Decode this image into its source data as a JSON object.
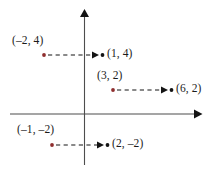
{
  "figure": {
    "kind": "coordinate-plane-translation-diagram",
    "width": 213,
    "height": 173,
    "background_color": "#ffffff"
  },
  "axes": {
    "x_axis": {
      "label": "x-axis",
      "color": "#4d4d4d",
      "y_pixel": 114,
      "x_start_pixel": 10,
      "x_end_pixel": 200,
      "arrow_end": "right"
    },
    "y_axis": {
      "label": "y-axis",
      "color": "#4d4d4d",
      "x_pixel": 84,
      "y_start_pixel": 165,
      "y_end_pixel": 10,
      "arrow_end": "up"
    }
  },
  "colors": {
    "source_point": "#8f2e2e",
    "destination_point": "#141414",
    "axis": "#4d4d4d",
    "arrow": "#141414",
    "label_text": "#1b1b1b"
  },
  "mappings": [
    {
      "id": "mapping-1",
      "source": {
        "label": "(–2, 4)",
        "x": -2,
        "y": 4,
        "pixel": {
          "x": 44,
          "y": 55
        },
        "label_pixel": {
          "x": 12,
          "y": 35
        },
        "color": "#8f2e2e"
      },
      "destination": {
        "label": "(1, 4)",
        "x": 1,
        "y": 4,
        "pixel": {
          "x": 102,
          "y": 55
        },
        "label_pixel": {
          "x": 107,
          "y": 48
        },
        "color": "#141414"
      },
      "arrow": {
        "style": "dashed",
        "from_pixel": {
          "x": 48,
          "y": 55
        },
        "to_pixel": {
          "x": 98,
          "y": 55
        }
      }
    },
    {
      "id": "mapping-2",
      "source": {
        "label": "(3, 2)",
        "x": 3,
        "y": 2,
        "pixel": {
          "x": 113,
          "y": 90
        },
        "label_pixel": {
          "x": 97,
          "y": 70
        },
        "color": "#8f2e2e"
      },
      "destination": {
        "label": "(6, 2)",
        "x": 6,
        "y": 2,
        "pixel": {
          "x": 171,
          "y": 90
        },
        "label_pixel": {
          "x": 176,
          "y": 83
        },
        "color": "#141414"
      },
      "arrow": {
        "style": "dashed",
        "from_pixel": {
          "x": 117,
          "y": 90
        },
        "to_pixel": {
          "x": 167,
          "y": 90
        }
      }
    },
    {
      "id": "mapping-3",
      "source": {
        "label": "(–1, –2)",
        "x": -1,
        "y": -2,
        "pixel": {
          "x": 52,
          "y": 145
        },
        "label_pixel": {
          "x": 17,
          "y": 124
        },
        "color": "#8f2e2e"
      },
      "destination": {
        "label": "(2, –2)",
        "x": 2,
        "y": -2,
        "pixel": {
          "x": 107,
          "y": 145
        },
        "label_pixel": {
          "x": 112,
          "y": 138
        },
        "color": "#141414"
      },
      "arrow": {
        "style": "dashed",
        "from_pixel": {
          "x": 56,
          "y": 145
        },
        "to_pixel": {
          "x": 103,
          "y": 145
        }
      }
    }
  ]
}
